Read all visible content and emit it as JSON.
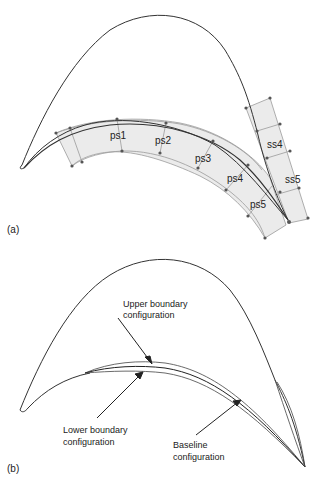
{
  "panel_a": {
    "tag": "(a)",
    "panel_labels": [
      "ps1",
      "ps2",
      "ps3",
      "ps4",
      "ps5",
      "ss4",
      "ss5"
    ]
  },
  "panel_b": {
    "tag": "(b)",
    "annotations": {
      "upper_line1": "Upper boundary",
      "upper_line2": "configuration",
      "lower_line1": "Lower boundary",
      "lower_line2": "configuration",
      "baseline_line1": "Baseline",
      "baseline_line2": "configuration"
    }
  },
  "colors": {
    "outline": "#333333",
    "panel_fill": "#ebebeb",
    "panel_edge": "#9a9a9a",
    "node": "#555555"
  }
}
